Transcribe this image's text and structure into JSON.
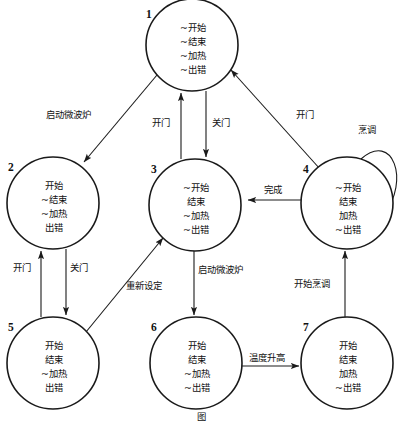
{
  "diagram": {
    "caption": "图",
    "type": "state-transition-diagram",
    "width": 403,
    "height": 422,
    "background_color": "#ffffff",
    "stroke_color": "#1a1a1a",
    "states": [
      {
        "id": "1",
        "cx": 192,
        "cy": 45,
        "r": 46,
        "label_x": 146,
        "label_y": 18,
        "attributes": [
          "~开始",
          "~结束",
          "~加热",
          "~出错"
        ]
      },
      {
        "id": "2",
        "cx": 53,
        "cy": 203,
        "r": 46,
        "label_x": 8,
        "label_y": 171,
        "attributes": [
          "开始",
          "~结束",
          "~加热",
          "出错"
        ]
      },
      {
        "id": "3",
        "cx": 195,
        "cy": 205,
        "r": 46,
        "label_x": 151,
        "label_y": 173,
        "attributes": [
          "~开始",
          "结束",
          "~加热",
          "~出错"
        ]
      },
      {
        "id": "4",
        "cx": 347,
        "cy": 203,
        "r": 46,
        "label_x": 303,
        "label_y": 173,
        "attributes": [
          "~开始",
          "结束",
          "加热",
          "~出错"
        ]
      },
      {
        "id": "5",
        "cx": 53,
        "cy": 363,
        "r": 46,
        "label_x": 8,
        "label_y": 331,
        "attributes": [
          "开始",
          "结束",
          "~加热",
          "出错"
        ]
      },
      {
        "id": "6",
        "cx": 196,
        "cy": 363,
        "r": 46,
        "label_x": 151,
        "label_y": 331,
        "attributes": [
          "开始",
          "结束",
          "~加热",
          "~出错"
        ]
      },
      {
        "id": "7",
        "cx": 347,
        "cy": 363,
        "r": 46,
        "label_x": 303,
        "label_y": 331,
        "attributes": [
          "开始",
          "结束",
          "加热",
          "~出错"
        ]
      }
    ],
    "transitions": [
      {
        "id": "t1",
        "from": "1",
        "to": "2",
        "label": "启动微波炉",
        "label_x": 46,
        "label_y": 118
      },
      {
        "id": "t2",
        "from": "3",
        "to": "1",
        "label": "开门",
        "label_x": 152,
        "label_y": 126
      },
      {
        "id": "t3",
        "from": "1",
        "to": "3",
        "label": "关门",
        "label_x": 212,
        "label_y": 126
      },
      {
        "id": "t4",
        "from": "4",
        "to": "1",
        "label": "开门",
        "label_x": 296,
        "label_y": 118
      },
      {
        "id": "t5",
        "from": "4",
        "to": "4",
        "label": "烹调",
        "label_x": 358,
        "label_y": 133
      },
      {
        "id": "t6",
        "from": "4",
        "to": "3",
        "label": "完成",
        "label_x": 264,
        "label_y": 193
      },
      {
        "id": "t7",
        "from": "5",
        "to": "2",
        "label": "开门",
        "label_x": 13,
        "label_y": 271
      },
      {
        "id": "t8",
        "from": "2",
        "to": "5",
        "label": "关门",
        "label_x": 70,
        "label_y": 271
      },
      {
        "id": "t9",
        "from": "5",
        "to": "3",
        "label": "重新设定",
        "label_x": 126,
        "label_y": 289
      },
      {
        "id": "t10",
        "from": "3",
        "to": "6",
        "label": "启动微波炉",
        "label_x": 198,
        "label_y": 273
      },
      {
        "id": "t11",
        "from": "6",
        "to": "7",
        "label": "温度升高",
        "label_x": 249,
        "label_y": 361
      },
      {
        "id": "t12",
        "from": "7",
        "to": "4",
        "label": "开始烹调",
        "label_x": 294,
        "label_y": 287
      }
    ]
  }
}
